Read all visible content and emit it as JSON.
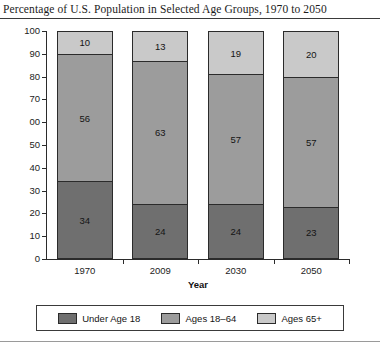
{
  "chart_data": {
    "type": "bar",
    "subtype": "stacked-column-100",
    "title": "Percentage of U.S. Population in Selected Age Groups, 1970 to 2050",
    "xlabel": "Year",
    "ylabel": "",
    "ylim": [
      0,
      100
    ],
    "yticks": [
      "0",
      "10",
      "20",
      "30",
      "40",
      "50",
      "00",
      "70",
      "80",
      "90",
      "100"
    ],
    "ytick_values": [
      0,
      10,
      20,
      30,
      40,
      50,
      60,
      70,
      80,
      90,
      100
    ],
    "grid": false,
    "legend_position": "bottom",
    "categories": [
      "1970",
      "2009",
      "2030",
      "2050"
    ],
    "series": [
      {
        "name": "Under Age 18",
        "color": "#6f6f6f",
        "values": [
          34,
          24,
          24,
          23
        ]
      },
      {
        "name": "Ages 18–64",
        "color": "#9c9c9c",
        "values": [
          56,
          63,
          57,
          57
        ]
      },
      {
        "name": "Ages 65+",
        "color": "#c9c9c9",
        "values": [
          10,
          13,
          19,
          20
        ]
      }
    ]
  }
}
